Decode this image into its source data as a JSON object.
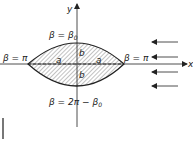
{
  "diagram": {
    "type": "lens-cross-section",
    "axes": {
      "x_label": "x",
      "y_label": "y"
    },
    "labels": {
      "left_vertex": "β = π",
      "right_vertex": "β = π",
      "top": {
        "main": "β = β",
        "sub": "0"
      },
      "bottom": {
        "main": "β = 2π − β",
        "sub": "0"
      },
      "half_width_left": "a",
      "half_width_right": "a",
      "half_height_top": "b",
      "half_height_bottom": "b"
    },
    "flow_arrows": {
      "count": 4,
      "direction": "left"
    },
    "colors": {
      "stroke": "#222222",
      "hatch": "#555555",
      "background": "#ffffff"
    }
  }
}
